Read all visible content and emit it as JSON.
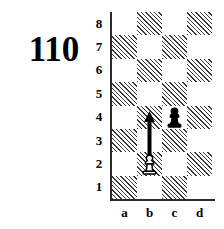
{
  "puzzle": {
    "number": "110"
  },
  "board": {
    "files": [
      "a",
      "b",
      "c",
      "d"
    ],
    "ranks": [
      "8",
      "7",
      "6",
      "5",
      "4",
      "3",
      "2",
      "1"
    ],
    "light_color": "#ffffff",
    "dark_color": "#3a3a3a",
    "axis_color": "#2b2b2b",
    "squares": [
      [
        "light",
        "dark",
        "light",
        "dark"
      ],
      [
        "dark",
        "light",
        "dark",
        "light"
      ],
      [
        "light",
        "dark",
        "light",
        "dark"
      ],
      [
        "dark",
        "light",
        "dark",
        "light"
      ],
      [
        "light",
        "dark",
        "light",
        "dark"
      ],
      [
        "dark",
        "light",
        "dark",
        "light"
      ],
      [
        "light",
        "dark",
        "light",
        "dark"
      ],
      [
        "dark",
        "light",
        "dark",
        "light"
      ]
    ]
  },
  "pieces": [
    {
      "name": "black-pawn",
      "piece": "pawn",
      "color": "black",
      "square": "c4",
      "file": 2,
      "rank": 4
    },
    {
      "name": "white-pawn",
      "piece": "pawn",
      "color": "white",
      "square": "b2",
      "file": 1,
      "rank": 2
    }
  ],
  "arrows": [
    {
      "name": "move-arrow",
      "from": "b2",
      "to": "b4",
      "file": 1,
      "from_rank": 2,
      "to_rank": 4,
      "color": "#000000",
      "direction": "up"
    }
  ]
}
